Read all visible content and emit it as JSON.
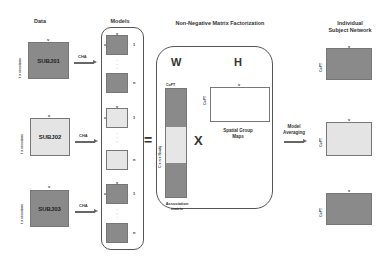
{
  "headers": {
    "data": "Data",
    "models": "Models",
    "nmf": "Non-Negative Matrix Factorization",
    "individual": "Individual\nSubject Network"
  },
  "subjects": [
    {
      "label": "SUBJ01",
      "shade": "dark",
      "row_axis": "t x sessions",
      "col_axis": "v",
      "arrow": "CHA"
    },
    {
      "label": "SUBJ02",
      "shade": "light",
      "row_axis": "t x sessions",
      "col_axis": "v",
      "arrow": "CHA"
    },
    {
      "label": "SUBJ03",
      "shade": "dark",
      "row_axis": "t x sessions",
      "col_axis": "v",
      "arrow": "CHA"
    }
  ],
  "models": {
    "row_axis": "c",
    "col_axis": "v",
    "first_index": "1",
    "last_index": "n",
    "ellipsis": "·\n·\n·"
  },
  "equals_sign": "=",
  "nmf": {
    "w_label": "W",
    "h_label": "H",
    "w_col_axis": "CoPT",
    "w_row_axis": "C x n x Nsubj",
    "w_caption": "Association matrix",
    "multiply_sign": "X",
    "h_row_axis": "CoPT",
    "h_col_axis": "v",
    "h_caption": "Spatial Group Maps"
  },
  "model_averaging": {
    "label": "Model Averaging"
  },
  "individual_networks": [
    {
      "shade": "dark",
      "row_axis": "CoPT",
      "col_axis": "v"
    },
    {
      "shade": "light",
      "row_axis": "CoPT",
      "col_axis": "v"
    },
    {
      "shade": "dark",
      "row_axis": "CoPT",
      "col_axis": "v"
    }
  ]
}
